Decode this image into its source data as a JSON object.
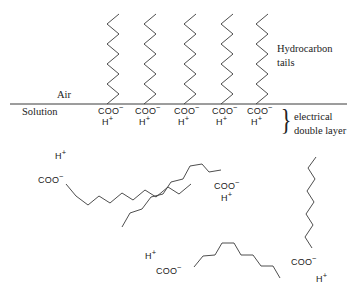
{
  "figure": {
    "background_color": "#ffffff",
    "stroke_color": "#3a3a3a",
    "text_color": "#1a1a1a"
  },
  "interface": {
    "air_label": "Air",
    "solution_label": "Solution",
    "line_y": 104
  },
  "annotations": {
    "hydrocarbon_tails_line1": "Hydrocarbon",
    "hydrocarbon_tails_line2": "tails",
    "electrical_double_layer_line1": "electrical",
    "electrical_double_layer_line2": "double layer",
    "brace_glyph": "}"
  },
  "chem": {
    "carboxylate": "COO",
    "carboxylate_charge": "−",
    "proton": "H",
    "proton_charge": "+"
  },
  "monolayer": {
    "count": 5,
    "molecules": [
      {
        "id": "monolayer-molecule-1",
        "x": 113,
        "head_x": 98,
        "head_y": 107
      },
      {
        "id": "monolayer-molecule-2",
        "x": 150,
        "head_x": 135,
        "head_y": 107
      },
      {
        "id": "monolayer-molecule-3",
        "x": 190,
        "head_x": 174,
        "head_y": 107
      },
      {
        "id": "monolayer-molecule-4",
        "x": 227,
        "head_x": 212,
        "head_y": 107
      },
      {
        "id": "monolayer-molecule-5",
        "x": 262,
        "head_x": 247,
        "head_y": 107
      }
    ],
    "tail_top_y": 14,
    "tail_bottom_y": 104,
    "zigzag_segments": 9,
    "zigzag_amplitude": 6
  },
  "bulk_molecules": [
    {
      "id": "bulk-molecule-1",
      "proton_x": 55,
      "proton_y": 152,
      "carboxylate_x": 38,
      "carboxylate_y": 176,
      "chain_points": "66,184 76,196 88,205 99,196 110,203 122,193 133,200 145,190 156,197 168,187 179,194 191,184"
    },
    {
      "id": "bulk-molecule-2",
      "carboxylate_x": 214,
      "carboxylate_y": 182,
      "proton_x": 221,
      "proton_y": 194,
      "chain_points": "122,227 130,213 142,209 151,197 163,194 171,182 183,179 190,166 202,164 209,172 221,170"
    },
    {
      "id": "bulk-molecule-3",
      "proton_x": 145,
      "proton_y": 252,
      "carboxylate_x": 156,
      "carboxylate_y": 267,
      "chain_points": "194,267 203,256 215,255 222,243 234,243 241,255 253,255 261,266 273,266 280,278"
    },
    {
      "id": "bulk-molecule-4",
      "carboxylate_x": 291,
      "carboxylate_y": 258,
      "proton_x": 316,
      "proton_y": 275,
      "chain_points": "312,248 305,237 313,225 306,214 314,202 307,191 315,179 308,168 316,157"
    }
  ]
}
